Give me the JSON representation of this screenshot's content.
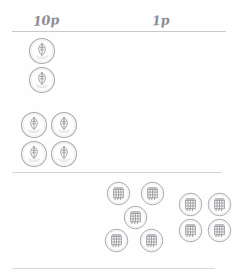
{
  "worksheet": {
    "title": "Coin sorting worksheet",
    "columns": [
      {
        "id": "col-10p",
        "label": "10p",
        "denomination": "10p",
        "coin_count": 6
      },
      {
        "id": "col-1p",
        "label": "1p",
        "denomination": "1p",
        "coin_count": 9
      }
    ],
    "rules": [
      {
        "name": "header-rule"
      },
      {
        "name": "middle-rule"
      },
      {
        "name": "bottom-rule"
      }
    ],
    "groups": [
      {
        "id": "group-10p-pair",
        "denomination": "10p",
        "column": "10p",
        "count": 2,
        "arrangement": "vertical-pair",
        "coins": [
          {
            "name": "coin-10p",
            "x": 28,
            "y": 37
          },
          {
            "name": "coin-10p",
            "x": 28,
            "y": 66
          }
        ]
      },
      {
        "id": "group-10p-quad",
        "denomination": "10p",
        "column": "10p",
        "count": 4,
        "arrangement": "2x2-grid",
        "coins": [
          {
            "name": "coin-10p",
            "x": 20,
            "y": 111
          },
          {
            "name": "coin-10p",
            "x": 50,
            "y": 111
          },
          {
            "name": "coin-10p",
            "x": 20,
            "y": 140
          },
          {
            "name": "coin-10p",
            "x": 50,
            "y": 140
          }
        ]
      },
      {
        "id": "group-1p-five",
        "denomination": "1p",
        "column": "1p",
        "count": 5,
        "arrangement": "quincunx",
        "coins": [
          {
            "name": "coin-1p",
            "x": 106,
            "y": 181
          },
          {
            "name": "coin-1p",
            "x": 140,
            "y": 181
          },
          {
            "name": "coin-1p",
            "x": 123,
            "y": 205
          },
          {
            "name": "coin-1p",
            "x": 104,
            "y": 228
          },
          {
            "name": "coin-1p",
            "x": 139,
            "y": 228
          }
        ]
      },
      {
        "id": "group-1p-quad",
        "denomination": "1p",
        "column": "1p",
        "count": 4,
        "arrangement": "2x2-grid",
        "coins": [
          {
            "name": "coin-1p",
            "x": 178,
            "y": 192
          },
          {
            "name": "coin-1p",
            "x": 207,
            "y": 192
          },
          {
            "name": "coin-1p",
            "x": 178,
            "y": 218
          },
          {
            "name": "coin-1p",
            "x": 207,
            "y": 218
          }
        ]
      }
    ],
    "colors": {
      "page_background": "#fefefe",
      "ink": "#8e8e93",
      "rule": "#c9c9cd",
      "coin_rim": "#a8a8ad",
      "coin_device": "#9a9a9f"
    }
  }
}
